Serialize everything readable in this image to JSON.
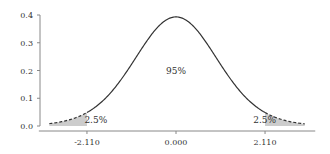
{
  "chart_data": {
    "type": "area",
    "title": "",
    "xlabel": "",
    "ylabel": "",
    "distribution": "t",
    "degrees_of_freedom": 17,
    "xlim": [
      -3.25,
      3.3
    ],
    "ylim": [
      0.0,
      0.4
    ],
    "y_ticks": [
      {
        "value": 0.0,
        "label": "0.0"
      },
      {
        "value": 0.1,
        "label": "0.1"
      },
      {
        "value": 0.2,
        "label": "0.2"
      },
      {
        "value": 0.3,
        "label": "0.3"
      },
      {
        "value": 0.4,
        "label": "0.4"
      }
    ],
    "x_ticks": [
      {
        "value": -2.11,
        "label": "-2.110"
      },
      {
        "value": 0.0,
        "label": "0.000"
      },
      {
        "value": 2.11,
        "label": "2.110"
      }
    ],
    "curve_range": [
      -3.0,
      3.05
    ],
    "critical_values": [
      -2.11,
      2.11
    ],
    "regions": [
      {
        "name": "left-tail",
        "from": -3.0,
        "to": -2.11,
        "label": "2.5%",
        "label_x": -1.9,
        "label_y": 0.02
      },
      {
        "name": "center",
        "from": -2.11,
        "to": 2.11,
        "label": "95%",
        "label_x": 0.0,
        "label_y": 0.2
      },
      {
        "name": "right-tail",
        "from": 2.11,
        "to": 3.05,
        "label": "2.5%",
        "label_x": 2.1,
        "label_y": 0.02
      }
    ],
    "grid": false,
    "legend": null,
    "colors": {
      "curve": "#333333",
      "tail_fill": "#cccccc",
      "axis": "#888888",
      "text": "#333333"
    }
  }
}
